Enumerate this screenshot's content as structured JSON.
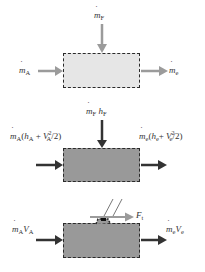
{
  "panels": [
    {
      "id": "mass-balance",
      "box_fill": "#e6e6e6",
      "arrow_color": "#9b9b9b",
      "labels": {
        "fuel_in": {
          "sym": "m",
          "sub": "F"
        },
        "air_in": {
          "sym": "m",
          "sub": "A"
        },
        "exit_out": {
          "sym": "m",
          "sub": "e"
        }
      }
    },
    {
      "id": "energy-balance",
      "box_fill": "#999999",
      "arrow_color": "#333333",
      "labels": {
        "fuel_in": {
          "sym": "m",
          "sub": "F",
          "h": "h",
          "h_sub": "F"
        },
        "air_in": {
          "sym": "m",
          "sub": "A",
          "open": "(",
          "h": "h",
          "h_sub": "A",
          "plus": " + ",
          "V": "V",
          "V_sup": "2",
          "V_sub": "A",
          "tail": "/2)"
        },
        "exit_out": {
          "sym": "m",
          "sub": "e",
          "open": "(",
          "h": "h",
          "h_sub": "e",
          "plus": "+ ",
          "V": "V",
          "V_sup": "2",
          "V_sub": "e",
          "tail": "/2)"
        }
      }
    },
    {
      "id": "momentum-balance",
      "box_fill": "#999999",
      "arrow_color": "#333333",
      "thrust_arrow_color": "#9b9b9b",
      "labels": {
        "air_in": {
          "sym": "m",
          "sub": "A",
          "V": "V",
          "V_sub": "A"
        },
        "exit_out": {
          "sym": "m",
          "sub": "e",
          "V": "V",
          "V_sub": "e"
        },
        "thrust": {
          "sym": "F",
          "sub": "t"
        }
      }
    }
  ]
}
